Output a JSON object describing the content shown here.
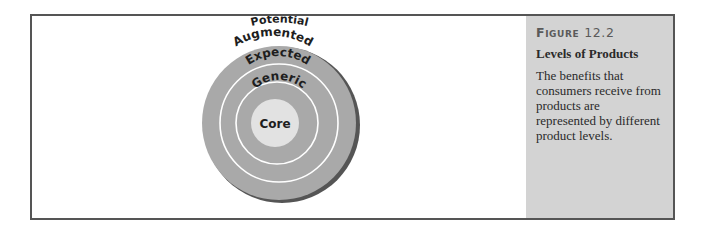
{
  "figure": {
    "label": "Figure",
    "number": "12.2",
    "title": "Levels of Products",
    "caption": "The benefits that consumers receive from products are represented by different product levels."
  },
  "diagram": {
    "type": "concentric-levels",
    "levels": [
      {
        "name": "Potential",
        "position": "outside-top"
      },
      {
        "name": "Augmented",
        "position": "outer-ring"
      },
      {
        "name": "Expected",
        "position": "ring-3"
      },
      {
        "name": "Generic",
        "position": "ring-2"
      },
      {
        "name": "Core",
        "position": "center"
      }
    ],
    "colors": {
      "ring_fill": "#a9a9a9",
      "core_fill": "#e2e2e2",
      "ring_line": "#ffffff",
      "shadow": "#555555",
      "panel_bg": "#d3d3d3",
      "frame_border": "#555555"
    }
  }
}
